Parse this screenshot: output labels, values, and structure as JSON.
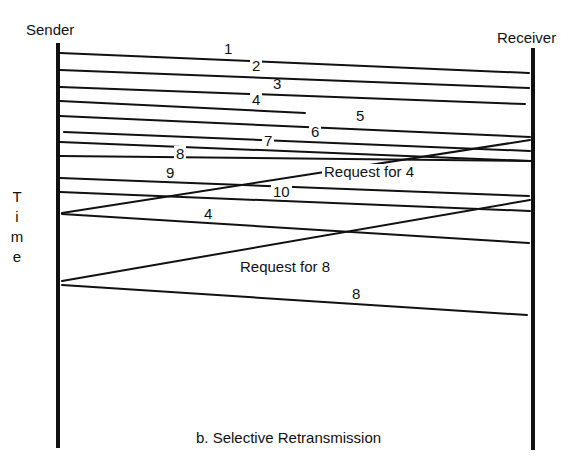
{
  "diagram": {
    "sender_label": "Sender",
    "receiver_label": "Receiver",
    "time_label": [
      "T",
      "i",
      "m",
      "e"
    ],
    "caption": "b. Selective Retransmission",
    "line_color": "#111111",
    "background": "#ffffff"
  },
  "messages": [
    {
      "label": "1",
      "from": "sender",
      "to": "receiver",
      "status": "delivered"
    },
    {
      "label": "2",
      "from": "sender",
      "to": "receiver",
      "status": "delivered"
    },
    {
      "label": "3",
      "from": "sender",
      "to": "receiver",
      "status": "delivered"
    },
    {
      "label": "4",
      "from": "sender",
      "to": "receiver",
      "status": "lost"
    },
    {
      "label": "5",
      "from": "sender",
      "to": "receiver",
      "status": "delivered"
    },
    {
      "label": "6",
      "from": "sender",
      "to": "receiver",
      "status": "delivered"
    },
    {
      "label": "7",
      "from": "sender",
      "to": "receiver",
      "status": "delivered"
    },
    {
      "label": "8",
      "from": "sender",
      "to": "receiver",
      "status": "delivered"
    },
    {
      "label": "9",
      "from": "sender",
      "to": "receiver",
      "status": "delivered"
    },
    {
      "label": "10",
      "from": "sender",
      "to": "receiver",
      "status": "delivered"
    },
    {
      "label": "Request for 4",
      "from": "receiver",
      "to": "sender",
      "status": "delivered"
    },
    {
      "label": "4",
      "from": "sender",
      "to": "receiver",
      "status": "retransmitted"
    },
    {
      "label": "Request for 8",
      "from": "receiver",
      "to": "sender",
      "status": "delivered"
    },
    {
      "label": "8",
      "from": "sender",
      "to": "receiver",
      "status": "retransmitted"
    }
  ]
}
